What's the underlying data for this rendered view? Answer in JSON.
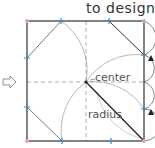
{
  "caption": "to design.",
  "diagram": {
    "labels": {
      "center": "center",
      "radius": "radius"
    },
    "square": {
      "left": 27,
      "top": 21,
      "right": 144,
      "bottom": 141
    },
    "center_point": [
      86,
      82
    ],
    "colors": {
      "outline": "#333333",
      "guide": "#888888",
      "marker_blue": "#4a8ab8",
      "marker_pink": "#e8a0b4",
      "arrow": "#222222"
    },
    "icons": [
      "right-arrow-icon",
      "triangle-marker-icon"
    ]
  }
}
